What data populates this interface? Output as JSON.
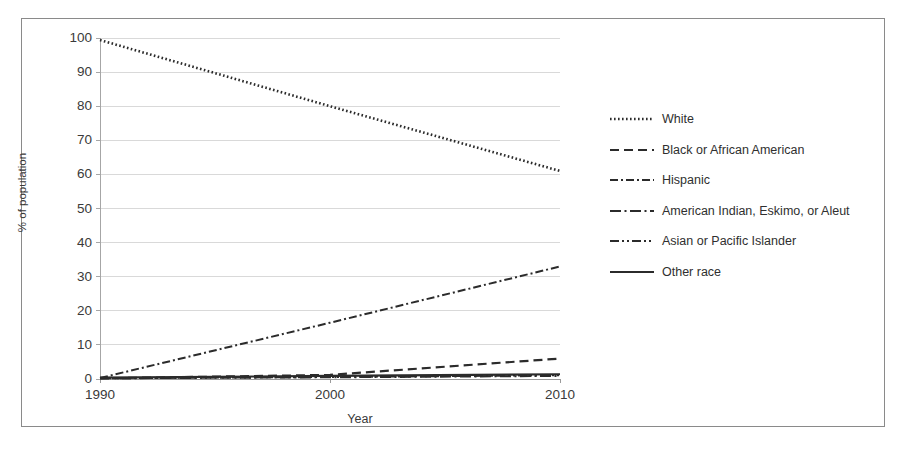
{
  "chart_data": {
    "type": "line",
    "title": "",
    "xlabel": "Year",
    "ylabel": "% of population",
    "x": [
      1990,
      2000,
      2010
    ],
    "categories": [
      "1990",
      "2000",
      "2010"
    ],
    "xlim": [
      1990,
      2010
    ],
    "ylim": [
      0,
      100
    ],
    "yticks": [
      0,
      10,
      20,
      30,
      40,
      50,
      60,
      70,
      80,
      90,
      100
    ],
    "ytick_labels": [
      "0",
      "10",
      "20",
      "30",
      "40",
      "50",
      "60",
      "70",
      "80",
      "90",
      "100"
    ],
    "xticks": [
      1990,
      2000,
      2010
    ],
    "xtick_labels": [
      "1990",
      "2000",
      "2010"
    ],
    "grid": "horizontal",
    "legend_position": "right",
    "line_color": "#2b2b2b",
    "grid_color": "#d9d9d9",
    "axis_color": "#a6a6a6",
    "frame_color": "#8a8a8a",
    "series": [
      {
        "name": "White",
        "style": "dotted",
        "values": [
          99.4,
          80.0,
          61.0
        ]
      },
      {
        "name": "Black or African American",
        "style": "dashed",
        "values": [
          0.2,
          1.2,
          6.0
        ]
      },
      {
        "name": "Hispanic",
        "style": "dash-dot",
        "values": [
          0.3,
          16.5,
          33.0
        ]
      },
      {
        "name": "American Indian, Eskimo, or Aleut",
        "style": "long-dash-dot",
        "values": [
          0.2,
          0.5,
          0.9
        ]
      },
      {
        "name": "Asian or Pacific Islander",
        "style": "dash-dot-dot",
        "values": [
          0.2,
          0.6,
          1.1
        ]
      },
      {
        "name": "Other race",
        "style": "solid",
        "values": [
          0.4,
          0.9,
          1.4
        ]
      }
    ]
  }
}
